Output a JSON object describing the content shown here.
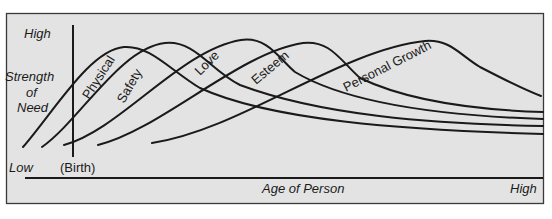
{
  "diagram": {
    "y_axis": {
      "label_line1": "Strength",
      "label_line2": "of",
      "label_line3": "Need",
      "high_label": "High",
      "low_label": "Low"
    },
    "x_axis": {
      "label": "Age of Person",
      "high_label": "High",
      "birth_label": "(Birth)"
    },
    "curves": [
      {
        "name": "Physical",
        "label": "Physical"
      },
      {
        "name": "Safety",
        "label": "Safety"
      },
      {
        "name": "Love",
        "label": "Love"
      },
      {
        "name": "Esteem",
        "label": "Esteem"
      },
      {
        "name": "Personal Growth",
        "label": "Personal Growth"
      }
    ],
    "colors": {
      "background": "#e3e3e3",
      "ink": "#1a1a1a",
      "page": "#ffffff"
    }
  }
}
